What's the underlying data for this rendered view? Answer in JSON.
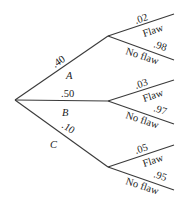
{
  "diagram": {
    "type": "probability-tree",
    "root": {
      "x": 15,
      "y": 100
    },
    "branches": [
      {
        "id": "A",
        "label": "A",
        "prob": ".40",
        "node": {
          "x": 108,
          "y": 36
        },
        "children": [
          {
            "label": "Flaw",
            "prob": ".02",
            "end": {
              "x": 174,
              "y": 14
            }
          },
          {
            "label": "No flaw",
            "prob": ".98",
            "end": {
              "x": 174,
              "y": 60
            }
          }
        ]
      },
      {
        "id": "B",
        "label": "B",
        "prob": ".50",
        "node": {
          "x": 108,
          "y": 101
        },
        "children": [
          {
            "label": "Flaw",
            "prob": ".03",
            "end": {
              "x": 174,
              "y": 80
            }
          },
          {
            "label": "No flaw",
            "prob": ".97",
            "end": {
              "x": 174,
              "y": 124
            }
          }
        ]
      },
      {
        "id": "C",
        "label": "C",
        "prob": ".10",
        "node": {
          "x": 108,
          "y": 167
        },
        "children": [
          {
            "label": "Flaw",
            "prob": ".05",
            "end": {
              "x": 174,
              "y": 145
            }
          },
          {
            "label": "No flaw",
            "prob": ".95",
            "end": {
              "x": 174,
              "y": 190
            }
          }
        ]
      }
    ]
  }
}
